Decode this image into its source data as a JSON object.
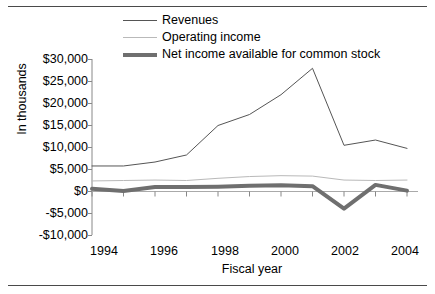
{
  "legend": {
    "items": [
      {
        "label": "Revenues",
        "color": "#555555",
        "width": 1
      },
      {
        "label": "Operating income",
        "color": "#b9b9b9",
        "width": 1
      },
      {
        "label": "Net income available for common stock",
        "color": "#6f6f6f",
        "width": 4
      }
    ]
  },
  "axes": {
    "ylabel": "In thousands",
    "xlabel": "Fiscal year",
    "yticks": [
      "$30,000",
      "$25,000",
      "$20,000",
      "$15,000",
      "$10,000",
      "$5,000",
      "$0",
      "-$5,000",
      "-$10,000"
    ],
    "xticks": [
      "1994",
      "1996",
      "1998",
      "2000",
      "2002",
      "2004"
    ]
  },
  "chart_data": {
    "type": "line",
    "title": "",
    "xlabel": "Fiscal year",
    "ylabel": "In thousands",
    "x": [
      1994,
      1995,
      1996,
      1997,
      1998,
      1999,
      2000,
      2001,
      2002,
      2003,
      2004
    ],
    "xlim": [
      1994,
      2004
    ],
    "ylim": [
      -10000,
      30000
    ],
    "ytick_values": [
      30000,
      25000,
      20000,
      15000,
      10000,
      5000,
      0,
      -5000,
      -10000
    ],
    "xtick_values": [
      1994,
      1996,
      1998,
      2000,
      2002,
      2004
    ],
    "grid": false,
    "legend_position": "top-center",
    "series": [
      {
        "name": "Revenues",
        "color": "#555555",
        "width": 1,
        "values": [
          5800,
          5800,
          6700,
          8300,
          15000,
          17500,
          22000,
          28000,
          10500,
          11700,
          9800
        ]
      },
      {
        "name": "Operating income",
        "color": "#b9b9b9",
        "width": 1,
        "values": [
          2400,
          2500,
          2600,
          2500,
          3000,
          3400,
          3600,
          3500,
          2600,
          2500,
          2600
        ]
      },
      {
        "name": "Net income available for common stock",
        "color": "#6f6f6f",
        "width": 4,
        "values": [
          600,
          100,
          1000,
          1000,
          1100,
          1300,
          1400,
          1200,
          -3900,
          1500,
          200
        ]
      }
    ]
  }
}
